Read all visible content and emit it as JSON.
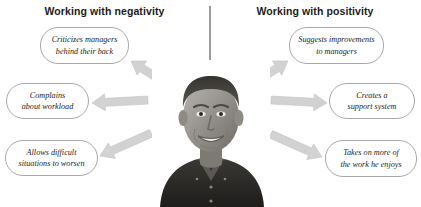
{
  "headings": {
    "left": "Working with negativity",
    "right": "Working with positivity"
  },
  "divider": {
    "name": "center-divider-line",
    "color": "#9b9b9b"
  },
  "colors": {
    "arrow_fill": "#d2d2d2",
    "arrow_stroke": "#c2c2c2",
    "box_border": "#a8a8a8",
    "text": "#1d1d1d",
    "heading_text": "#1b1b1b",
    "background": "#ffffff"
  },
  "negativity_items": [
    {
      "id": "criticizes",
      "line1": "Criticizes managers",
      "line2": "behind their back",
      "arrow_direction": "up-left"
    },
    {
      "id": "complains",
      "line1": "Complains",
      "line2": "about workload",
      "arrow_direction": "left"
    },
    {
      "id": "allows",
      "line1": "Allows difficult",
      "line2": "situations to worsen",
      "arrow_direction": "down-left"
    }
  ],
  "positivity_items": [
    {
      "id": "suggests",
      "line1": "Suggests improvements",
      "line2": "to managers",
      "arrow_direction": "up-right"
    },
    {
      "id": "creates",
      "line1": "Creates a",
      "line2": "support system",
      "arrow_direction": "right"
    },
    {
      "id": "takes",
      "line1": "Takes on more of",
      "line2": "the work he enjoys",
      "arrow_direction": "down-right"
    }
  ],
  "photo": {
    "name": "portrait-photo",
    "description": "Grayscale photograph of a smiling middle-aged man with short dark hair wearing a dark collared shirt"
  }
}
